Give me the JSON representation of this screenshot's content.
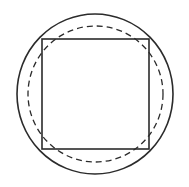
{
  "diagram": {
    "colors": {
      "stroke": "#2b2b2b",
      "background": "#ffffff"
    },
    "shapes": {
      "outer_circle": {
        "cx": 95,
        "cy": 94,
        "rx": 78,
        "ry": 80,
        "style": "solid"
      },
      "dashed_circle": {
        "cx": 95.5,
        "cy": 94,
        "rx": 67.5,
        "ry": 68,
        "style": "dashed"
      },
      "square": {
        "x": 42,
        "y": 39,
        "width": 107,
        "height": 110,
        "style": "solid"
      }
    }
  }
}
